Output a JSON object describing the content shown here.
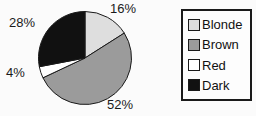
{
  "chart_data": {
    "type": "pie",
    "title": "",
    "categories": [
      "Blonde",
      "Brown",
      "Red",
      "Dark"
    ],
    "values": [
      16,
      52,
      4,
      28
    ],
    "slice_labels": [
      "16%",
      "52%",
      "4%",
      "28%"
    ],
    "colors": [
      "#dedede",
      "#9b9b9b",
      "#ffffff",
      "#111111"
    ],
    "outline_color": "#1a1a1a",
    "start_angle_deg": 0,
    "direction": "clockwise",
    "legend_position": "right",
    "legend_entries": [
      "Blonde",
      "Brown",
      "Red",
      "Dark"
    ]
  }
}
